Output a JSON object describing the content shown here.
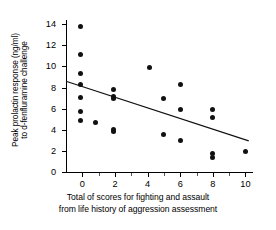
{
  "chart_data": {
    "type": "scatter",
    "title": "",
    "xlabel": "Total of scores for fighting and assault from life history of aggression assessment",
    "xlabel_lines": [
      "Total of scores for fighting and assault",
      "from life history of aggression assessment"
    ],
    "ylabel": "Peak prolactin response (ng/ml) to d-fenfluramine challenge",
    "ylabel_lines": [
      "Peak prolactin response (ng/ml)",
      "to d-fenfluramine challenge"
    ],
    "xlim": [
      -1,
      10.4
    ],
    "ylim": [
      0,
      14.4
    ],
    "xticks": [
      0,
      2,
      4,
      6,
      8,
      10
    ],
    "xticklabels": [
      "0",
      "2",
      "4",
      "6",
      "8",
      "10"
    ],
    "xminorticks": [
      1,
      3,
      5,
      7,
      9
    ],
    "yticks": [
      0,
      2,
      4,
      6,
      8,
      10,
      12,
      14
    ],
    "yticklabels": [
      "0",
      "2",
      "4",
      "6",
      "8",
      "10",
      "12",
      "14"
    ],
    "grid": false,
    "legend": false,
    "marker": "filled-circle",
    "marker_color": "#111111",
    "axis_color": "#000000",
    "points": [
      {
        "x": -0.1,
        "y": 13.8
      },
      {
        "x": -0.1,
        "y": 11.1
      },
      {
        "x": -0.1,
        "y": 9.3
      },
      {
        "x": -0.1,
        "y": 8.3
      },
      {
        "x": -0.1,
        "y": 7.05
      },
      {
        "x": -0.1,
        "y": 5.7
      },
      {
        "x": -0.1,
        "y": 4.9
      },
      {
        "x": 0.8,
        "y": 4.7
      },
      {
        "x": 1.9,
        "y": 7.85
      },
      {
        "x": 1.9,
        "y": 7.15
      },
      {
        "x": 1.9,
        "y": 6.95
      },
      {
        "x": 1.9,
        "y": 4.0
      },
      {
        "x": 1.9,
        "y": 3.8
      },
      {
        "x": 4.1,
        "y": 9.9
      },
      {
        "x": 5.0,
        "y": 6.95
      },
      {
        "x": 5.0,
        "y": 3.6
      },
      {
        "x": 6.0,
        "y": 8.25
      },
      {
        "x": 6.0,
        "y": 5.9
      },
      {
        "x": 6.0,
        "y": 2.95
      },
      {
        "x": 8.0,
        "y": 5.9
      },
      {
        "x": 8.0,
        "y": 5.15
      },
      {
        "x": 8.0,
        "y": 1.75
      },
      {
        "x": 8.0,
        "y": 1.35
      },
      {
        "x": 10.0,
        "y": 1.9
      }
    ],
    "regression_line": {
      "x_start": -1.0,
      "y_start": 8.6,
      "x_end": 10.2,
      "y_end": 2.95,
      "color": "#111111"
    }
  }
}
